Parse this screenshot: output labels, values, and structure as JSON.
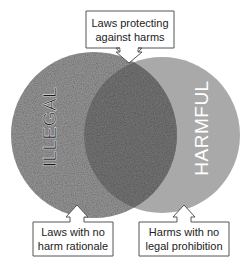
{
  "diagram": {
    "type": "venn",
    "sets": [
      {
        "id": "illegal",
        "label": "ILLEGAL",
        "fill": "#8a8a8a",
        "texture": "speckled",
        "label_color": "#1a1a1a"
      },
      {
        "id": "harmful",
        "label": "HARMFUL",
        "fill": "#a9a9a9",
        "texture": "flat",
        "label_color": "#ffffff"
      }
    ],
    "intersection_fill": "#6e6e6e",
    "callouts": {
      "top": {
        "line1": "Laws protecting",
        "line2": "against harms",
        "points_to": "intersection"
      },
      "bottom_left": {
        "line1": "Laws with no",
        "line2": "harm rationale",
        "points_to": "illegal-only"
      },
      "bottom_right": {
        "line1": "Harms with no",
        "line2": "legal prohibition",
        "points_to": "harmful-only"
      }
    }
  }
}
